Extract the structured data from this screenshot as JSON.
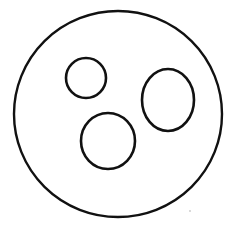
{
  "figure": {
    "background_color": "#ffffff",
    "stroke_color": "#111111",
    "fill": "none",
    "canvas": {
      "width": 234,
      "height": 232
    }
  },
  "shapes": [
    {
      "name": "outer-circle",
      "label": "Large outer circle",
      "type": "ellipse",
      "cx": 118,
      "cy": 114,
      "rx": 104,
      "ry": 103,
      "stroke_width": 2.4
    },
    {
      "name": "inner-circle-top-left",
      "label": "Small circle, upper left",
      "type": "ellipse",
      "cx": 86,
      "cy": 78,
      "rx": 20,
      "ry": 20,
      "stroke_width": 2.6
    },
    {
      "name": "inner-ellipse-right",
      "label": "Oval, middle right",
      "type": "ellipse",
      "cx": 168,
      "cy": 100,
      "rx": 26,
      "ry": 31,
      "stroke_width": 2.6
    },
    {
      "name": "inner-circle-bottom-center",
      "label": "Circle, lower center",
      "type": "ellipse",
      "cx": 108,
      "cy": 141,
      "rx": 27,
      "ry": 28,
      "stroke_width": 2.6
    }
  ],
  "artifacts": [
    {
      "name": "scan-speck",
      "label": "Faint scan speck",
      "cx": 190,
      "cy": 211,
      "r": 0.9,
      "color": "#c8c8c8"
    }
  ]
}
